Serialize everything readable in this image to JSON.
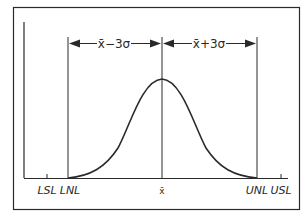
{
  "diagram": {
    "colors": {
      "stroke": "#2a2a2a",
      "background": "#ffffff"
    },
    "span_labels": {
      "left": "x̄−3σ",
      "right": "x̄+3σ"
    },
    "axis_labels": {
      "lsl": "LSL",
      "lnl": "LNL",
      "mean": "x̄",
      "unl": "UNL",
      "usl": "USL"
    }
  }
}
